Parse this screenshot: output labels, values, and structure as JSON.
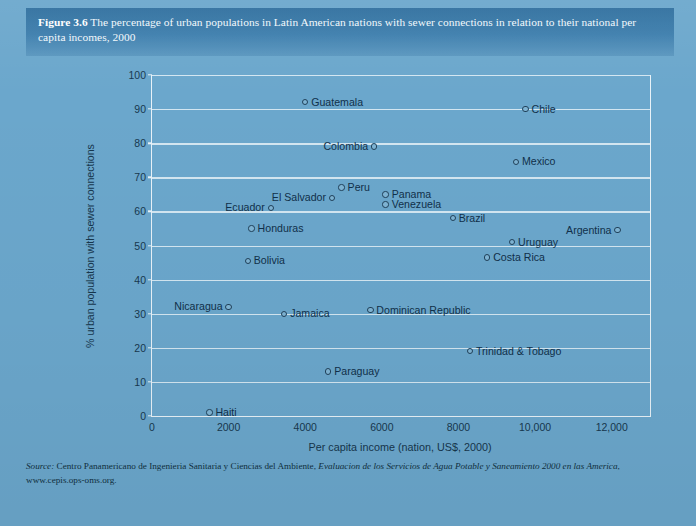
{
  "figure": {
    "label": "Figure 3.6",
    "caption": "The percentage of urban populations in Latin American nations with sewer connections in relation to their national per capita incomes, 2000"
  },
  "source": {
    "lead": "Source:",
    "body": "Centro Panamericano de Ingenieria Sanitaria y Ciencias del Ambiente,",
    "italic_title": "Evaluacion de los Servicios de Agua Potable y Saneamiento 2000 en las America",
    "tail": ",",
    "url": "www.cepis.ops-oms.org."
  },
  "colors": {
    "page_background": "#6ba7cc",
    "caption_band": "#3d7ead",
    "gridline": "#dcebf4",
    "axis": "#e8f2f8",
    "marker_edge": "#20415a",
    "text": "#10304a"
  },
  "chart_data": {
    "type": "scatter",
    "title": "The percentage of urban populations in Latin American nations with sewer connections in relation to their national per capita incomes, 2000",
    "xlabel": "Per capita income (nation, US$, 2000)",
    "ylabel": "% urban population with sewer connections",
    "xlim": [
      0,
      13000
    ],
    "ylim": [
      0,
      100
    ],
    "xticks": [
      0,
      2000,
      4000,
      6000,
      8000,
      10000,
      12000
    ],
    "xticklabels": [
      "0",
      "2000",
      "4000",
      "6000",
      "8000",
      "10,000",
      "12,000"
    ],
    "yticks": [
      0,
      10,
      20,
      30,
      40,
      50,
      60,
      70,
      80,
      90,
      100
    ],
    "yticklabels": [
      "0",
      "10",
      "20",
      "30",
      "40",
      "50",
      "60",
      "70",
      "80",
      "90",
      "100"
    ],
    "grid": "horizontal",
    "legend": "none",
    "points": [
      {
        "name": "Guatemala",
        "x": 4000,
        "y": 92,
        "label_side": "right"
      },
      {
        "name": "Chile",
        "x": 9750,
        "y": 90,
        "label_side": "right"
      },
      {
        "name": "Colombia",
        "x": 5800,
        "y": 79,
        "label_side": "left"
      },
      {
        "name": "Mexico",
        "x": 9500,
        "y": 74.5,
        "label_side": "right"
      },
      {
        "name": "Peru",
        "x": 4950,
        "y": 67,
        "label_side": "right"
      },
      {
        "name": "Panama",
        "x": 6100,
        "y": 65,
        "label_side": "right"
      },
      {
        "name": "El Salvador",
        "x": 4700,
        "y": 64,
        "label_side": "left"
      },
      {
        "name": "Venezuela",
        "x": 6100,
        "y": 62,
        "label_side": "right"
      },
      {
        "name": "Ecuador",
        "x": 3100,
        "y": 61,
        "label_side": "left"
      },
      {
        "name": "Brazil",
        "x": 7850,
        "y": 58,
        "label_side": "right"
      },
      {
        "name": "Honduras",
        "x": 2600,
        "y": 55,
        "label_side": "right"
      },
      {
        "name": "Argentina",
        "x": 12150,
        "y": 54.5,
        "label_side": "left"
      },
      {
        "name": "Uruguay",
        "x": 9400,
        "y": 51,
        "label_side": "right"
      },
      {
        "name": "Costa Rica",
        "x": 8750,
        "y": 46.5,
        "label_side": "right"
      },
      {
        "name": "Bolivia",
        "x": 2500,
        "y": 45.5,
        "label_side": "right"
      },
      {
        "name": "Nicaragua",
        "x": 2000,
        "y": 32,
        "label_side": "left"
      },
      {
        "name": "Dominican Republic",
        "x": 5700,
        "y": 31,
        "label_side": "right"
      },
      {
        "name": "Jamaica",
        "x": 3450,
        "y": 30,
        "label_side": "right"
      },
      {
        "name": "Trinidad & Tobago",
        "x": 8300,
        "y": 19,
        "label_side": "right"
      },
      {
        "name": "Paraguay",
        "x": 4600,
        "y": 13,
        "label_side": "right"
      },
      {
        "name": "Haiti",
        "x": 1500,
        "y": 1,
        "label_side": "right"
      }
    ]
  }
}
